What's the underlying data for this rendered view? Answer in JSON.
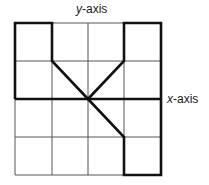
{
  "labels": {
    "y_axis_var": "y",
    "y_axis_suffix": "-axis",
    "x_axis_var": "x",
    "x_axis_suffix": "-axis"
  },
  "grid": {
    "columns": 4,
    "rows": 4,
    "origin": "center"
  },
  "figure": {
    "path_points_grid": [
      [
        -2,
        2
      ],
      [
        -1,
        2
      ],
      [
        -1,
        1
      ],
      [
        0,
        0
      ],
      [
        1,
        1
      ],
      [
        1,
        2
      ],
      [
        2,
        2
      ],
      [
        2,
        -2
      ],
      [
        1,
        -2
      ],
      [
        1,
        -1
      ],
      [
        0,
        0
      ]
    ],
    "extra_segments_grid": [
      [
        [
          -2,
          2
        ],
        [
          -2,
          0
        ]
      ],
      [
        [
          -2,
          0
        ],
        [
          2,
          0
        ]
      ]
    ],
    "line_color": "#111111",
    "grid_color": "#555555"
  }
}
